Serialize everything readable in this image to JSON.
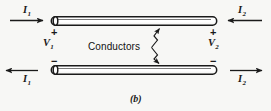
{
  "figure": {
    "caption": "(b)",
    "center_label": "Conductors",
    "background_color": "#f7f7f5",
    "line_color": "#1a1a1a",
    "conductor_fill": "#ffffff",
    "top_left": {
      "current_label": "I",
      "current_sub": "1",
      "current_direction": "right",
      "polarity": "+",
      "voltage_label": "V",
      "voltage_sub": "1"
    },
    "top_right": {
      "current_label": "I",
      "current_sub": "2",
      "current_direction": "left",
      "polarity": "+",
      "voltage_label": "V",
      "voltage_sub": "2"
    },
    "bottom_left": {
      "current_label": "I",
      "current_sub": "1",
      "current_direction": "left",
      "polarity": "−"
    },
    "bottom_right": {
      "current_label": "I",
      "current_sub": "2",
      "current_direction": "right",
      "polarity": "−"
    }
  }
}
